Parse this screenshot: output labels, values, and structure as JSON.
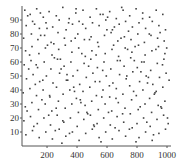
{
  "chart_data": {
    "type": "scatter",
    "title": "",
    "xlabel": "",
    "ylabel": "",
    "xlim": [
      33,
      1020
    ],
    "ylim": [
      0,
      100
    ],
    "grid": false,
    "legend": "none",
    "x_ticks": [
      200,
      400,
      600,
      800,
      1000
    ],
    "x_tick_labels": [
      "200",
      "400",
      "600",
      "800",
      "1000"
    ],
    "y_ticks": [
      10,
      20,
      30,
      40,
      50,
      60,
      70,
      80,
      90
    ],
    "y_tick_labels": [
      "10",
      "20",
      "30",
      "40",
      "50",
      "60",
      "70",
      "80",
      "90"
    ],
    "marker_color": "#444444",
    "points": [
      [
        52,
        97
      ],
      [
        88,
        94
      ],
      [
        131,
        98
      ],
      [
        175,
        92
      ],
      [
        214,
        96
      ],
      [
        262,
        93
      ],
      [
        305,
        99
      ],
      [
        348,
        91
      ],
      [
        392,
        95
      ],
      [
        440,
        97
      ],
      [
        487,
        92
      ],
      [
        529,
        98
      ],
      [
        573,
        94
      ],
      [
        618,
        96
      ],
      [
        662,
        91
      ],
      [
        707,
        97
      ],
      [
        751,
        93
      ],
      [
        794,
        98
      ],
      [
        838,
        95
      ],
      [
        884,
        92
      ],
      [
        928,
        97
      ],
      [
        972,
        94
      ],
      [
        61,
        86
      ],
      [
        104,
        89
      ],
      [
        149,
        84
      ],
      [
        193,
        88
      ],
      [
        238,
        85
      ],
      [
        281,
        90
      ],
      [
        327,
        83
      ],
      [
        370,
        87
      ],
      [
        414,
        89
      ],
      [
        458,
        84
      ],
      [
        503,
        88
      ],
      [
        547,
        86
      ],
      [
        592,
        90
      ],
      [
        636,
        83
      ],
      [
        681,
        87
      ],
      [
        724,
        89
      ],
      [
        769,
        85
      ],
      [
        813,
        88
      ],
      [
        857,
        84
      ],
      [
        902,
        89
      ],
      [
        946,
        86
      ],
      [
        990,
        83
      ],
      [
        44,
        77
      ],
      [
        96,
        80
      ],
      [
        139,
        76
      ],
      [
        184,
        79
      ],
      [
        227,
        74
      ],
      [
        273,
        81
      ],
      [
        316,
        77
      ],
      [
        361,
        75
      ],
      [
        405,
        80
      ],
      [
        449,
        76
      ],
      [
        494,
        78
      ],
      [
        538,
        74
      ],
      [
        583,
        79
      ],
      [
        627,
        81
      ],
      [
        672,
        75
      ],
      [
        716,
        78
      ],
      [
        760,
        76
      ],
      [
        805,
        80
      ],
      [
        849,
        74
      ],
      [
        893,
        79
      ],
      [
        937,
        77
      ],
      [
        981,
        75
      ],
      [
        57,
        68
      ],
      [
        100,
        71
      ],
      [
        146,
        66
      ],
      [
        189,
        70
      ],
      [
        233,
        65
      ],
      [
        278,
        69
      ],
      [
        322,
        72
      ],
      [
        366,
        67
      ],
      [
        411,
        70
      ],
      [
        455,
        64
      ],
      [
        499,
        68
      ],
      [
        544,
        71
      ],
      [
        588,
        66
      ],
      [
        633,
        69
      ],
      [
        677,
        64
      ],
      [
        721,
        70
      ],
      [
        766,
        67
      ],
      [
        810,
        72
      ],
      [
        854,
        65
      ],
      [
        899,
        68
      ],
      [
        943,
        71
      ],
      [
        986,
        66
      ],
      [
        48,
        58
      ],
      [
        93,
        61
      ],
      [
        137,
        56
      ],
      [
        181,
        60
      ],
      [
        226,
        55
      ],
      [
        270,
        62
      ],
      [
        314,
        57
      ],
      [
        359,
        60
      ],
      [
        403,
        54
      ],
      [
        447,
        59
      ],
      [
        492,
        62
      ],
      [
        536,
        56
      ],
      [
        580,
        60
      ],
      [
        625,
        55
      ],
      [
        669,
        61
      ],
      [
        714,
        57
      ],
      [
        758,
        63
      ],
      [
        802,
        56
      ],
      [
        847,
        60
      ],
      [
        891,
        54
      ],
      [
        935,
        59
      ],
      [
        979,
        62
      ],
      [
        63,
        48
      ],
      [
        107,
        51
      ],
      [
        151,
        46
      ],
      [
        196,
        50
      ],
      [
        240,
        45
      ],
      [
        284,
        52
      ],
      [
        329,
        47
      ],
      [
        373,
        50
      ],
      [
        418,
        44
      ],
      [
        462,
        49
      ],
      [
        506,
        52
      ],
      [
        551,
        46
      ],
      [
        595,
        50
      ],
      [
        639,
        45
      ],
      [
        684,
        51
      ],
      [
        728,
        48
      ],
      [
        772,
        53
      ],
      [
        817,
        46
      ],
      [
        861,
        50
      ],
      [
        905,
        44
      ],
      [
        950,
        49
      ],
      [
        994,
        52
      ],
      [
        41,
        38
      ],
      [
        86,
        41
      ],
      [
        130,
        36
      ],
      [
        174,
        40
      ],
      [
        219,
        35
      ],
      [
        263,
        42
      ],
      [
        307,
        37
      ],
      [
        352,
        40
      ],
      [
        396,
        34
      ],
      [
        440,
        39
      ],
      [
        485,
        42
      ],
      [
        529,
        36
      ],
      [
        573,
        40
      ],
      [
        618,
        35
      ],
      [
        662,
        41
      ],
      [
        706,
        37
      ],
      [
        751,
        43
      ],
      [
        795,
        36
      ],
      [
        839,
        40
      ],
      [
        884,
        34
      ],
      [
        928,
        39
      ],
      [
        972,
        42
      ],
      [
        55,
        28
      ],
      [
        99,
        31
      ],
      [
        143,
        26
      ],
      [
        188,
        30
      ],
      [
        232,
        25
      ],
      [
        276,
        32
      ],
      [
        321,
        27
      ],
      [
        365,
        30
      ],
      [
        409,
        24
      ],
      [
        454,
        29
      ],
      [
        498,
        32
      ],
      [
        542,
        26
      ],
      [
        587,
        30
      ],
      [
        631,
        25
      ],
      [
        675,
        31
      ],
      [
        720,
        27
      ],
      [
        764,
        33
      ],
      [
        808,
        26
      ],
      [
        853,
        30
      ],
      [
        897,
        24
      ],
      [
        941,
        29
      ],
      [
        986,
        32
      ],
      [
        46,
        18
      ],
      [
        90,
        21
      ],
      [
        135,
        16
      ],
      [
        179,
        20
      ],
      [
        223,
        15
      ],
      [
        268,
        22
      ],
      [
        312,
        17
      ],
      [
        356,
        20
      ],
      [
        401,
        14
      ],
      [
        445,
        19
      ],
      [
        489,
        22
      ],
      [
        534,
        16
      ],
      [
        578,
        20
      ],
      [
        622,
        15
      ],
      [
        667,
        21
      ],
      [
        711,
        17
      ],
      [
        755,
        23
      ],
      [
        800,
        16
      ],
      [
        844,
        20
      ],
      [
        888,
        14
      ],
      [
        933,
        19
      ],
      [
        977,
        22
      ],
      [
        59,
        8
      ],
      [
        103,
        11
      ],
      [
        148,
        6
      ],
      [
        192,
        10
      ],
      [
        236,
        5
      ],
      [
        281,
        12
      ],
      [
        325,
        7
      ],
      [
        369,
        10
      ],
      [
        414,
        4
      ],
      [
        458,
        9
      ],
      [
        502,
        12
      ],
      [
        547,
        6
      ],
      [
        591,
        10
      ],
      [
        635,
        5
      ],
      [
        680,
        11
      ],
      [
        724,
        7
      ],
      [
        768,
        13
      ],
      [
        813,
        6
      ],
      [
        857,
        10
      ],
      [
        901,
        4
      ],
      [
        946,
        9
      ],
      [
        990,
        12
      ],
      [
        71,
        93
      ],
      [
        117,
        87
      ],
      [
        158,
        79
      ],
      [
        203,
        72
      ],
      [
        249,
        63
      ],
      [
        294,
        55
      ],
      [
        338,
        47
      ],
      [
        383,
        39
      ],
      [
        426,
        31
      ],
      [
        471,
        23
      ],
      [
        515,
        14
      ],
      [
        560,
        3
      ],
      [
        604,
        92
      ],
      [
        649,
        85
      ],
      [
        693,
        77
      ],
      [
        737,
        69
      ],
      [
        782,
        61
      ],
      [
        826,
        53
      ],
      [
        870,
        45
      ],
      [
        915,
        37
      ],
      [
        959,
        28
      ],
      [
        1003,
        20
      ],
      [
        78,
        55
      ],
      [
        122,
        44
      ],
      [
        166,
        33
      ],
      [
        211,
        22
      ],
      [
        255,
        11
      ],
      [
        299,
        2
      ],
      [
        344,
        88
      ],
      [
        388,
        77
      ],
      [
        432,
        66
      ],
      [
        477,
        57
      ],
      [
        521,
        46
      ],
      [
        565,
        35
      ],
      [
        610,
        24
      ],
      [
        654,
        13
      ],
      [
        698,
        99
      ],
      [
        743,
        82
      ],
      [
        787,
        71
      ],
      [
        831,
        60
      ],
      [
        876,
        49
      ],
      [
        920,
        38
      ],
      [
        964,
        27
      ],
      [
        1008,
        16
      ],
      [
        67,
        25
      ],
      [
        112,
        14
      ],
      [
        156,
        95
      ],
      [
        200,
        84
      ],
      [
        245,
        73
      ],
      [
        289,
        62
      ],
      [
        333,
        51
      ],
      [
        378,
        42
      ],
      [
        422,
        33
      ],
      [
        466,
        24
      ],
      [
        511,
        15
      ],
      [
        555,
        94
      ],
      [
        599,
        83
      ],
      [
        644,
        72
      ],
      [
        688,
        61
      ],
      [
        732,
        50
      ],
      [
        777,
        39
      ],
      [
        821,
        28
      ],
      [
        865,
        17
      ],
      [
        910,
        8
      ],
      [
        954,
        81
      ],
      [
        998,
        70
      ],
      [
        84,
        65
      ],
      [
        128,
        58
      ],
      [
        172,
        47
      ],
      [
        217,
        36
      ],
      [
        261,
        27
      ],
      [
        305,
        18
      ],
      [
        350,
        9
      ],
      [
        394,
        98
      ],
      [
        438,
        87
      ],
      [
        483,
        76
      ],
      [
        527,
        65
      ],
      [
        571,
        54
      ],
      [
        616,
        43
      ],
      [
        660,
        34
      ],
      [
        704,
        23
      ],
      [
        749,
        12
      ],
      [
        793,
        3
      ],
      [
        837,
        91
      ],
      [
        882,
        80
      ],
      [
        926,
        69
      ],
      [
        970,
        58
      ],
      [
        1014,
        47
      ]
    ]
  }
}
